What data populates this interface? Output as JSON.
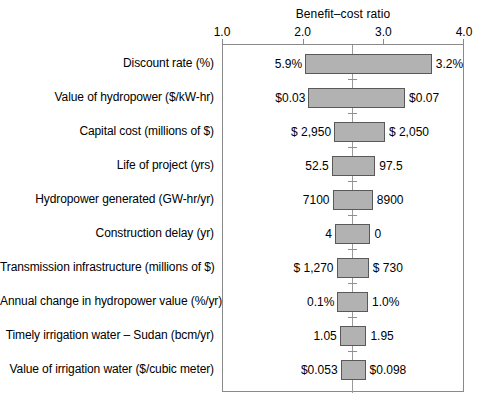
{
  "chart_data": {
    "type": "bar",
    "subtype": "tornado-diagram",
    "title": "Benefit–cost ratio",
    "xlabel": "Benefit–cost ratio",
    "ylabel": "",
    "xlim": [
      1.0,
      4.0
    ],
    "xticks": [
      "1.0",
      "2.0",
      "3.0",
      "4.0"
    ],
    "xtick_values": [
      1.0,
      2.0,
      3.0,
      4.0
    ],
    "grid": false,
    "legend": "none",
    "base_case_value": 2.61,
    "categories": [
      "Discount rate (%)",
      "Value of hydropower ($/kW-hr)",
      "Capital cost (millions of $)",
      "Life of project (yrs)",
      "Hydropower generated (GW-hr/yr)",
      "Construction delay (yr)",
      "Transmission infrastructure (millions of $)",
      "Annual change in hydropower value (%/yr)",
      "Timely irrigation water – Sudan (bcm/yr)",
      "Value of irrigation water ($/cubic meter)"
    ],
    "bars": [
      {
        "label": "Discount rate (%)",
        "low_label": "5.9%",
        "high_label": "3.2%",
        "low_ratio": 2.03,
        "high_ratio": 3.6
      },
      {
        "label": "Value of hydropower ($/kW-hr)",
        "low_label": "$0.03",
        "high_label": "$0.07",
        "low_ratio": 2.07,
        "high_ratio": 3.27
      },
      {
        "label": "Capital cost (millions of $)",
        "low_label": "$  2,950",
        "high_label": "$  2,050",
        "low_ratio": 2.39,
        "high_ratio": 3.02
      },
      {
        "label": "Life of project (yrs)",
        "low_label": "52.5",
        "high_label": "97.5",
        "low_ratio": 2.36,
        "high_ratio": 2.9
      },
      {
        "label": "Hydropower generated (GW-hr/yr)",
        "low_label": "7100",
        "high_label": "8900",
        "low_ratio": 2.37,
        "high_ratio": 2.87
      },
      {
        "label": "Construction delay (yr)",
        "low_label": "4",
        "high_label": "0",
        "low_ratio": 2.4,
        "high_ratio": 2.84
      },
      {
        "label": "Transmission infrastructure (millions of $)",
        "low_label": "$  1,270",
        "high_label": "$     730",
        "low_ratio": 2.42,
        "high_ratio": 2.82
      },
      {
        "label": "Annual change in hydropower value (%/yr)",
        "low_label": "0.1%",
        "high_label": "1.0%",
        "low_ratio": 2.43,
        "high_ratio": 2.81
      },
      {
        "label": "Timely irrigation water – Sudan (bcm/yr)",
        "low_label": "1.05",
        "high_label": "1.95",
        "low_ratio": 2.46,
        "high_ratio": 2.79
      },
      {
        "label": "Value of irrigation water ($/cubic meter)",
        "low_label": "$0.053",
        "high_label": "$0.098",
        "low_ratio": 2.47,
        "high_ratio": 2.78
      }
    ],
    "colors": {
      "bar_fill": "#b2b2b2",
      "bar_stroke": "#595959",
      "axis": "#8a8a8a",
      "baseline": "#9a9a9a",
      "text": "#000000",
      "background": "#ffffff"
    }
  }
}
